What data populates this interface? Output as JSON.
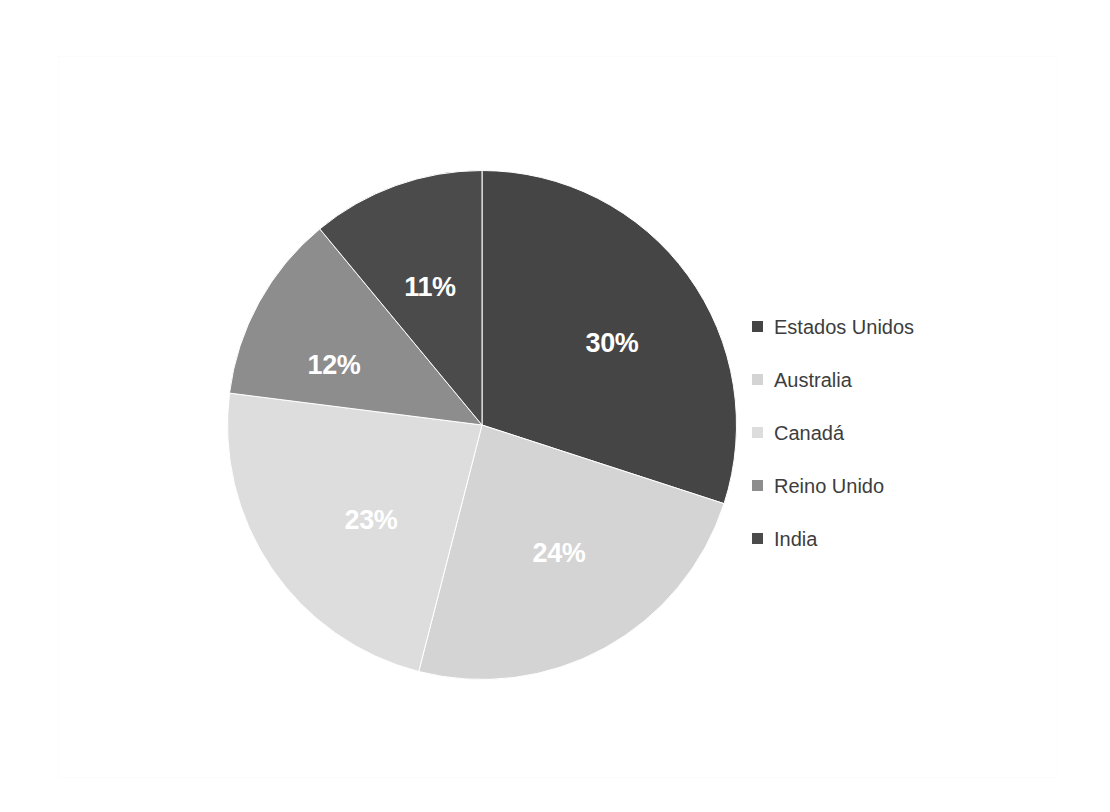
{
  "chart_data": {
    "type": "pie",
    "title": "",
    "subtitle": "",
    "xlabel": "",
    "ylabel": "",
    "grid": false,
    "legend_position": "right",
    "start_angle_deg": 0,
    "direction": "clockwise",
    "categories": [
      "Estados Unidos",
      "Australia",
      "Canadá",
      "Reino Unido",
      "India"
    ],
    "values": [
      30,
      24,
      23,
      12,
      11
    ],
    "data_labels": [
      "30%",
      "24%",
      "23%",
      "12%",
      "11%"
    ],
    "colors": [
      "#454545",
      "#d4d4d4",
      "#dddddd",
      "#8d8d8d",
      "#4b4b4b"
    ],
    "slices": [
      {
        "name": "Estados Unidos",
        "value": 30,
        "label": "30%",
        "color": "#454545",
        "start_deg": 0,
        "end_deg": 108,
        "label_x": 612,
        "label_y": 343
      },
      {
        "name": "Australia",
        "value": 24,
        "label": "24%",
        "color": "#d4d4d4",
        "start_deg": 108,
        "end_deg": 194.4,
        "label_x": 559,
        "label_y": 553
      },
      {
        "name": "Canadá",
        "value": 23,
        "label": "23%",
        "color": "#dddddd",
        "start_deg": 194.4,
        "end_deg": 277.2,
        "label_x": 371,
        "label_y": 520
      },
      {
        "name": "Reino Unido",
        "value": 12,
        "label": "12%",
        "color": "#8d8d8d",
        "start_deg": 277.2,
        "end_deg": 320.4,
        "label_x": 334,
        "label_y": 365
      },
      {
        "name": "India",
        "value": 11,
        "label": "11%",
        "color": "#4b4b4b",
        "start_deg": 320.4,
        "end_deg": 360,
        "label_x": 430,
        "label_y": 287
      }
    ]
  },
  "legend": {
    "items": [
      {
        "label": "Estados Unidos",
        "color": "#454545"
      },
      {
        "label": "Australia",
        "color": "#d4d4d4"
      },
      {
        "label": "Canadá",
        "color": "#dddddd"
      },
      {
        "label": "Reino Unido",
        "color": "#8d8d8d"
      },
      {
        "label": "India",
        "color": "#4b4b4b"
      }
    ]
  },
  "canvas": {
    "background": "#ffffff",
    "frame_color": "#fcfcfc"
  }
}
